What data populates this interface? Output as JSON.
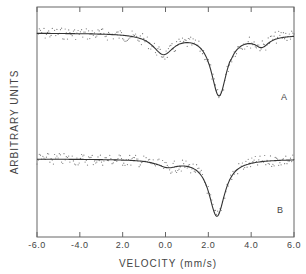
{
  "chart_data": {
    "type": "line",
    "title": "",
    "xlabel": "VELOCITY (mm/s)",
    "ylabel": "ARBITRARY UNITS",
    "xlim": [
      -6.0,
      6.0
    ],
    "x_ticks": [
      -6.0,
      -4.0,
      -2.0,
      0.0,
      2.0,
      4.0,
      6.0
    ],
    "x_tick_labels": [
      "-6.0",
      "-4.0",
      "2.0",
      "0.0",
      "2.0",
      "4.0",
      "6.0"
    ],
    "grid": false,
    "legend": "none",
    "series": [
      {
        "name": "A",
        "style": "data points with fitted curve",
        "baseline": 1.0,
        "features": [
          {
            "type": "absorption_minimum",
            "velocity": -0.1,
            "relative_depth": 0.2
          },
          {
            "type": "absorption_minimum",
            "velocity": 2.5,
            "relative_depth": 0.62
          },
          {
            "type": "shoulder",
            "velocity": 4.5,
            "relative_depth": 0.1
          }
        ]
      },
      {
        "name": "B",
        "style": "data points with fitted curve",
        "baseline": 1.0,
        "features": [
          {
            "type": "absorption_minimum",
            "velocity": 0.1,
            "relative_depth": 0.07
          },
          {
            "type": "absorption_minimum",
            "velocity": 2.4,
            "relative_depth": 0.6
          }
        ]
      }
    ]
  },
  "labels": {
    "series_a": "A",
    "series_b": "B"
  }
}
